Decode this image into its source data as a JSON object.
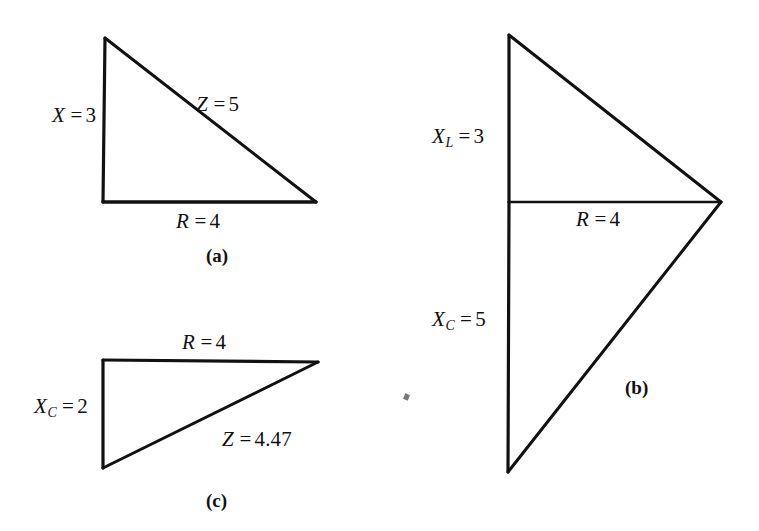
{
  "figure": {
    "background_color": "#ffffff",
    "stroke_color": "#111111",
    "panels": [
      {
        "id": "a",
        "caption": "(a)",
        "caption_x": 206,
        "caption_y": 246,
        "shape": "right-triangle",
        "vertices": [
          [
            105,
            38
          ],
          [
            103,
            202
          ],
          [
            316,
            202
          ]
        ],
        "labels": [
          {
            "name": "reactance",
            "var": "X",
            "sub": "",
            "eq": "=",
            "num": "3",
            "text": "X = 3",
            "x": 52,
            "y": 105
          },
          {
            "name": "impedance",
            "var": "Z",
            "sub": "",
            "eq": "=",
            "num": "5",
            "text": "Z = 5",
            "x": 196,
            "y": 94
          },
          {
            "name": "resistance",
            "var": "R",
            "sub": "",
            "eq": "=",
            "num": "4",
            "text": "R = 4",
            "x": 176,
            "y": 211
          }
        ]
      },
      {
        "id": "b",
        "caption": "(b)",
        "caption_x": 625,
        "caption_y": 378,
        "shape": "double-triangle",
        "vertices": [
          [
            509,
            35
          ],
          [
            721,
            202
          ],
          [
            508,
            472
          ]
        ],
        "midpoint": [
          509,
          202
        ],
        "labels": [
          {
            "name": "inductive-reactance",
            "var": "X",
            "sub": "L",
            "eq": "=",
            "num": "3",
            "text": "XL = 3",
            "x": 432,
            "y": 126
          },
          {
            "name": "resistance",
            "var": "R",
            "sub": "",
            "eq": "=",
            "num": "4",
            "text": "R = 4",
            "x": 576,
            "y": 209
          },
          {
            "name": "capacitive-reactance",
            "var": "X",
            "sub": "C",
            "eq": "=",
            "num": "5",
            "text": "XC = 5",
            "x": 432,
            "y": 309
          }
        ]
      },
      {
        "id": "c",
        "caption": "(c)",
        "caption_x": 206,
        "caption_y": 491,
        "shape": "right-triangle",
        "vertices": [
          [
            103,
            360
          ],
          [
            318,
            362
          ],
          [
            103,
            468
          ]
        ],
        "labels": [
          {
            "name": "resistance",
            "var": "R",
            "sub": "",
            "eq": "=",
            "num": "4",
            "text": "R = 4",
            "x": 182,
            "y": 332
          },
          {
            "name": "capacitive-reactance",
            "var": "X",
            "sub": "C",
            "eq": "=",
            "num": "2",
            "text": "XC = 2",
            "x": 34,
            "y": 396
          },
          {
            "name": "impedance",
            "var": "Z",
            "sub": "",
            "eq": "=",
            "num": "4.47",
            "text": "Z = 4.47",
            "x": 222,
            "y": 429
          }
        ]
      }
    ],
    "speck": {
      "x": 404,
      "y": 394
    }
  }
}
